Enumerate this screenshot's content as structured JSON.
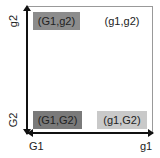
{
  "diagram": {
    "cells": [
      {
        "label": "(G1,g2)",
        "fill": "#8c8c8c",
        "position": "top-left"
      },
      {
        "label": "(g1,g2)",
        "fill": "#ffffff",
        "position": "top-right"
      },
      {
        "label": "(G1,G2)",
        "fill": "#7a7a7a",
        "position": "bottom-left"
      },
      {
        "label": "(g1,G2)",
        "fill": "#c9c9c9",
        "position": "bottom-right"
      }
    ],
    "x_axis": {
      "left_label": "G1",
      "right_label": "g1"
    },
    "y_axis": {
      "top_label": "g2",
      "bottom_label": "G2"
    }
  }
}
